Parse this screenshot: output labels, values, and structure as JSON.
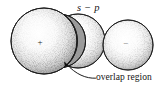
{
  "figure": {
    "caption_labels": {
      "orbital_label": "s − p",
      "overlap_label": "overlap region"
    },
    "spheres": [
      {
        "name": "left-sphere",
        "symbol": "+",
        "cx": 44,
        "cy": 41,
        "r": 33,
        "symbol_visible": true
      },
      {
        "name": "middle-sphere",
        "symbol": "",
        "cx": 78,
        "cy": 41,
        "r": 27,
        "symbol_visible": false
      },
      {
        "name": "right-sphere",
        "symbol": "−",
        "cx": 128,
        "cy": 45,
        "r": 25,
        "symbol_visible": true
      }
    ],
    "overlap_region": {
      "name": "overlap-lens",
      "fill": "#9b9b9b",
      "stroke": "#1c1c1c"
    },
    "leader_line": {
      "name": "overlap-leader-arrow",
      "tip_x": 64,
      "tip_y": 62,
      "end_x": 96,
      "end_y": 78
    },
    "colors": {
      "background": "#ffffff",
      "outline": "#1c1c1c",
      "stipple": "#4a4a4a",
      "overlap_fill": "#9b9b9b",
      "text": "#141414"
    }
  }
}
